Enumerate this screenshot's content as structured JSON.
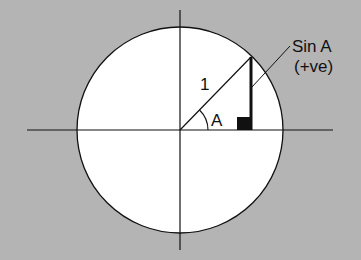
{
  "diagram": {
    "colors": {
      "background": "#b4b4b4",
      "circle_fill": "#ffffff",
      "stroke": "#111111"
    },
    "labels": {
      "radius": "1",
      "angle": "A",
      "sin_line": "Sin A",
      "sign": "(+ve)"
    }
  }
}
